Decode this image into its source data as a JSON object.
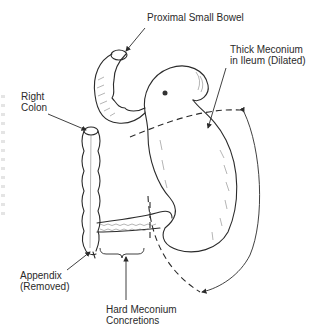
{
  "figure": {
    "type": "medical line illustration"
  },
  "labels": {
    "proximal_small_bowel": "Proximal Small Bowel",
    "thick_meconium_line1": "Thick Meconium",
    "thick_meconium_line2": "in Ileum (Dilated)",
    "right_colon_line1": "Right",
    "right_colon_line2": "Colon",
    "appendix_line1": "Appendix",
    "appendix_line2": "(Removed)",
    "hard_meconium_line1": "Hard Meconium",
    "hard_meconium_line2": "Concretions"
  },
  "colors": {
    "ink": "#2b2b2b",
    "background": "#ffffff"
  }
}
